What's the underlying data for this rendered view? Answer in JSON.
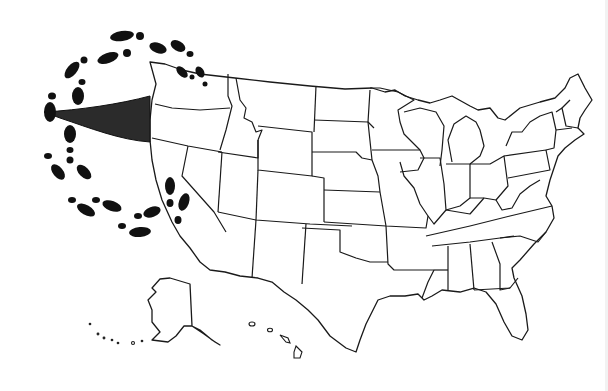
{
  "image": {
    "description": "Black-and-white outline map of the United States with a trail of footprints circling the Pacific Northwest and a dark funnel/flag shape pointing at Oregon",
    "colors": {
      "background": "#ffffff",
      "outline": "#1a1a1a",
      "footprints": "#111111",
      "funnel": "#2b2b2b"
    }
  },
  "map": {
    "regions": [
      "contiguous-us",
      "alaska",
      "hawaii"
    ],
    "annotation": {
      "type": "footprint-loop",
      "target_region": "pacific-northwest",
      "pointer": "funnel-shape"
    },
    "labels": []
  }
}
